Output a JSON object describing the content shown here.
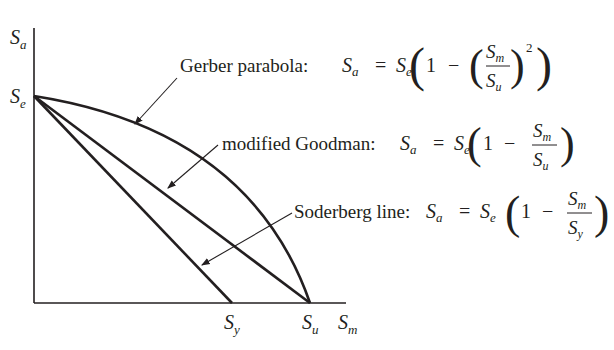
{
  "axes": {
    "y_label": "S",
    "y_sub": "a",
    "x_label": "S",
    "x_sub": "m",
    "se_label": "S",
    "se_sub": "e",
    "sy_label": "S",
    "sy_sub": "y",
    "su_label": "S",
    "su_sub": "u"
  },
  "curves": {
    "gerber": {
      "name": "Gerber parabola:",
      "lhs": "S",
      "lhs_sub": "a",
      "eq": "=",
      "se": "S",
      "se_sub": "e",
      "one": "1",
      "minus": "−",
      "num": "S",
      "num_sub": "m",
      "den": "S",
      "den_sub": "u",
      "power": "2"
    },
    "goodman": {
      "name": "modified Goodman:",
      "lhs": "S",
      "lhs_sub": "a",
      "eq": "=",
      "se": "S",
      "se_sub": "e",
      "one": "1",
      "minus": "−",
      "num": "S",
      "num_sub": "m",
      "den": "S",
      "den_sub": "u"
    },
    "soderberg": {
      "name": "Soderberg line:",
      "lhs": "S",
      "lhs_sub": "a",
      "eq": "=",
      "se": "S",
      "se_sub": "e",
      "one": "1",
      "minus": "−",
      "num": "S",
      "num_sub": "m",
      "den": "S",
      "den_sub": "y"
    }
  },
  "colors": {
    "ink": "#231f20",
    "background": "#ffffff"
  }
}
